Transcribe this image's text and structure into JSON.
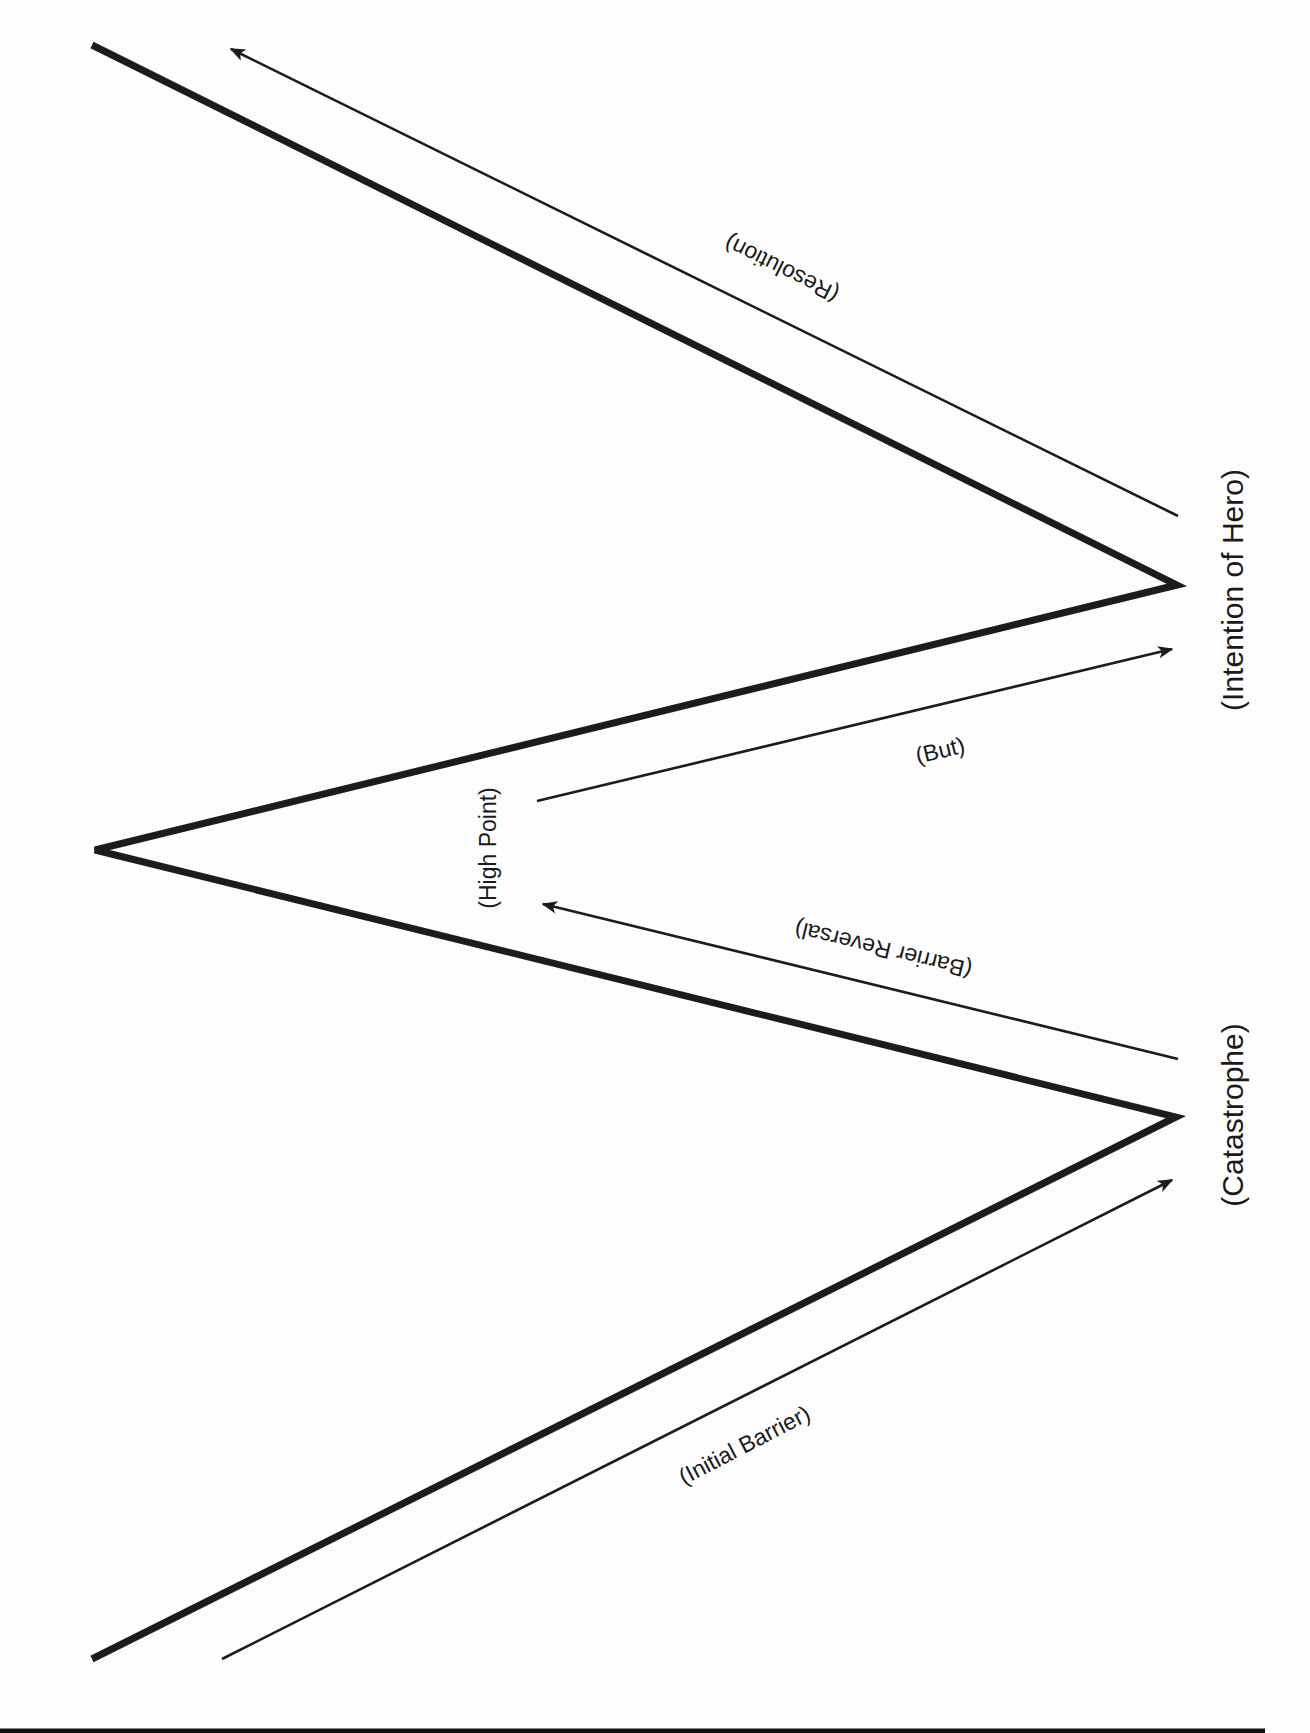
{
  "diagram": {
    "type": "story-structure-zigzag",
    "vertices": {
      "start_bottom": {
        "x": 92,
        "y": 1659
      },
      "catastrophe": {
        "x": 1176,
        "y": 1117
      },
      "high_point": {
        "x": 95,
        "y": 850
      },
      "intention_of_hero": {
        "x": 1177,
        "y": 585
      },
      "end_top": {
        "x": 92,
        "y": 45
      }
    },
    "labels": {
      "catastrophe": "(Catastrophe)",
      "intention_of_hero": "(Intention of Hero)",
      "high_point": "(High Point)",
      "initial_barrier": "(Initial Barrier)",
      "barrier_reversal": "(Barrier Reversal)",
      "but": "(But)",
      "resolution": "(Resolution)"
    },
    "arrows": [
      {
        "name": "initial-barrier",
        "from": [
          222,
          1659
        ],
        "to": [
          1178,
          1177
        ],
        "label": "(Initial Barrier)"
      },
      {
        "name": "barrier-reversal",
        "from": [
          1178,
          1059
        ],
        "to": [
          537,
          902
        ],
        "label": "(Barrier Reversal)"
      },
      {
        "name": "but",
        "from": [
          537,
          801
        ],
        "to": [
          1178,
          647
        ],
        "label": "(But)"
      },
      {
        "name": "resolution",
        "from": [
          1178,
          516
        ],
        "to": [
          225,
          46
        ],
        "label": "(Resolution)"
      }
    ],
    "colors": {
      "ink": "#1c1c1c",
      "paper": "#fdfdfd"
    }
  }
}
